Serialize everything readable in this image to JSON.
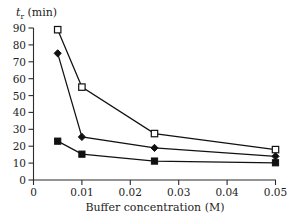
{
  "chart_data": {
    "type": "line",
    "title": "",
    "xlabel": "Buffer concentration (M)",
    "ylabel": "t_r (min)",
    "ylabel_parts": {
      "symbol": "t",
      "subscript": "r",
      "unit": " (min)"
    },
    "x": [
      0.005,
      0.01,
      0.025,
      0.05
    ],
    "xlim": [
      0,
      0.05
    ],
    "ylim": [
      0,
      90
    ],
    "xticks": [
      0,
      0.01,
      0.02,
      0.03,
      0.04,
      0.05
    ],
    "xtick_labels": [
      "0",
      "0.01",
      "0.02",
      "0.03",
      "0.04",
      "0.05"
    ],
    "yticks": [
      0,
      10,
      20,
      30,
      40,
      50,
      60,
      70,
      80,
      90
    ],
    "ytick_labels": [
      "0",
      "10",
      "20",
      "30",
      "40",
      "50",
      "60",
      "70",
      "80",
      "90"
    ],
    "grid": false,
    "legend": "none",
    "series": [
      {
        "name": "series-open-square",
        "marker": "open-square",
        "color": "#111111",
        "values": [
          89,
          55,
          27.5,
          18
        ]
      },
      {
        "name": "series-filled-diamond",
        "marker": "filled-diamond",
        "color": "#111111",
        "values": [
          75,
          25.5,
          19,
          14
        ]
      },
      {
        "name": "series-filled-square",
        "marker": "filled-square",
        "color": "#111111",
        "values": [
          23,
          15.3,
          11.2,
          10.2
        ]
      }
    ]
  }
}
